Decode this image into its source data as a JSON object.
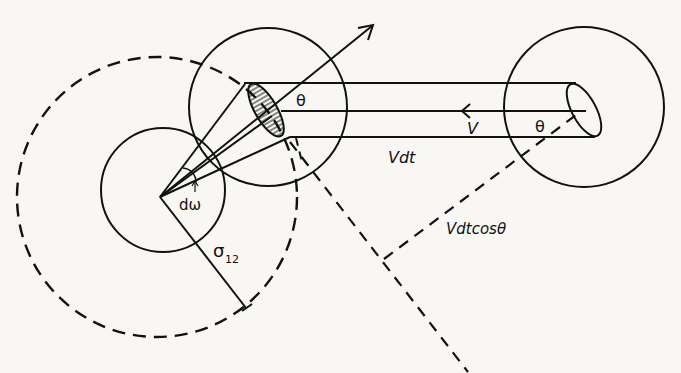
{
  "diagram": {
    "labels": {
      "theta_left": "θ",
      "theta_right": "θ",
      "velocity": "V",
      "vdt": "Vdt",
      "d_omega": "dω",
      "sigma": "σ",
      "sigma_sub": "12",
      "vdtcos": "Vdtcosθ"
    },
    "colors": {
      "ink": "#111111",
      "background": "#f8f7f4"
    }
  }
}
